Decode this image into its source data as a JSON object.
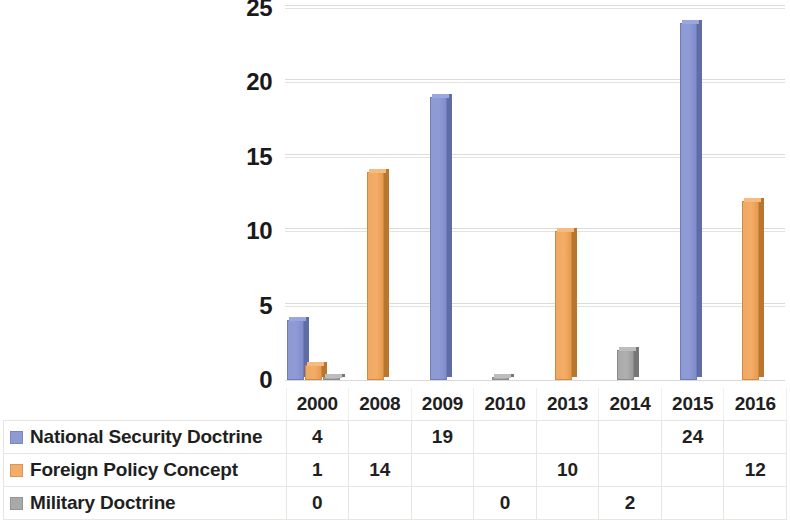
{
  "chart_data": {
    "type": "bar",
    "title": "",
    "xlabel": "",
    "ylabel": "",
    "categories": [
      "2000",
      "2008",
      "2009",
      "2010",
      "2013",
      "2014",
      "2015",
      "2016"
    ],
    "series": [
      {
        "name": "National Security Doctrine",
        "color": "#8d9ad4",
        "swatch": "blue",
        "values": [
          4,
          null,
          19,
          null,
          null,
          null,
          24,
          null
        ],
        "cells": [
          "4",
          "",
          "19",
          "",
          "",
          "",
          "24",
          ""
        ]
      },
      {
        "name": "Foreign Policy Concept",
        "color": "#f3ad68",
        "swatch": "orange",
        "values": [
          1,
          14,
          null,
          null,
          10,
          null,
          null,
          12
        ],
        "cells": [
          "1",
          "14",
          "",
          "",
          "10",
          "",
          "",
          "12"
        ]
      },
      {
        "name": "Military Doctrine",
        "color": "#a9a9a9",
        "swatch": "grey",
        "values": [
          0,
          null,
          null,
          0,
          null,
          2,
          null,
          null
        ],
        "cells": [
          "0",
          "",
          "",
          "0",
          "",
          "2",
          "",
          ""
        ]
      }
    ],
    "ylim": [
      0,
      25
    ],
    "yticks": [
      0,
      5,
      10,
      15,
      20,
      25
    ],
    "ytick_labels": [
      "0",
      "5",
      "10",
      "15",
      "20",
      "25"
    ],
    "grid": true,
    "legend_position": "data-table",
    "style": "3-D clustered column with data table"
  },
  "table": {
    "corner_label": ""
  }
}
